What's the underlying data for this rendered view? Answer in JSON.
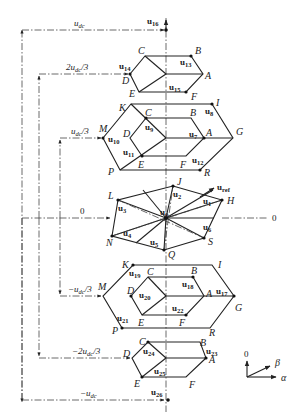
{
  "levels": [
    {
      "id": "udc",
      "label": "u",
      "label_sub": "dc",
      "prefix": "",
      "suffix": "",
      "y": 30
    },
    {
      "id": "2udc3",
      "label": "u",
      "label_sub": "dc",
      "prefix": "2",
      "suffix": "/3",
      "y": 74
    },
    {
      "id": "udc3",
      "label": "u",
      "label_sub": "dc",
      "prefix": "",
      "suffix": "/3",
      "y": 138
    },
    {
      "id": "zero",
      "label": "0",
      "y": 218
    },
    {
      "id": "mudc3",
      "label": "u",
      "label_sub": "dc",
      "prefix": "−",
      "suffix": "/3",
      "y": 296
    },
    {
      "id": "m2udc3",
      "label": "u",
      "label_sub": "dc",
      "prefix": "−2",
      "suffix": "/3",
      "y": 358
    },
    {
      "id": "mudc",
      "label": "u",
      "label_sub": "dc",
      "prefix": "−",
      "suffix": "",
      "y": 400
    }
  ],
  "zero_right_label": "0",
  "vectors": {
    "u0": {
      "name": "u",
      "sub": "0"
    },
    "u1": {
      "name": "u",
      "sub": "1"
    },
    "u2": {
      "name": "u",
      "sub": "2"
    },
    "u3": {
      "name": "u",
      "sub": "3"
    },
    "u4": {
      "name": "u",
      "sub": "4"
    },
    "u5": {
      "name": "u",
      "sub": "5"
    },
    "u6": {
      "name": "u",
      "sub": "6"
    },
    "u7": {
      "name": "u",
      "sub": "7"
    },
    "u8": {
      "name": "u",
      "sub": "8"
    },
    "u9": {
      "name": "u",
      "sub": "9"
    },
    "u10": {
      "name": "u",
      "sub": "10"
    },
    "u11": {
      "name": "u",
      "sub": "11"
    },
    "u12": {
      "name": "u",
      "sub": "12"
    },
    "u13": {
      "name": "u",
      "sub": "13"
    },
    "u14": {
      "name": "u",
      "sub": "14"
    },
    "u15": {
      "name": "u",
      "sub": "15"
    },
    "u16": {
      "name": "u",
      "sub": "16"
    },
    "u17": {
      "name": "u",
      "sub": "17"
    },
    "u18": {
      "name": "u",
      "sub": "18"
    },
    "u19": {
      "name": "u",
      "sub": "19"
    },
    "u20": {
      "name": "u",
      "sub": "20"
    },
    "u21": {
      "name": "u",
      "sub": "21"
    },
    "u22": {
      "name": "u",
      "sub": "22"
    },
    "u23": {
      "name": "u",
      "sub": "23"
    },
    "u24": {
      "name": "u",
      "sub": "24"
    },
    "u25": {
      "name": "u",
      "sub": "25"
    },
    "u26": {
      "name": "u",
      "sub": "26"
    },
    "uref": {
      "name": "u",
      "sub": "ref"
    }
  },
  "vertex_labels": {
    "A": "A",
    "B": "B",
    "C": "C",
    "D": "D",
    "E": "E",
    "F": "F",
    "G": "G",
    "H": "H",
    "I": "I",
    "J": "J",
    "K": "K",
    "L": "L",
    "M": "M",
    "N": "N",
    "P": "P",
    "Q": "Q",
    "R": "R",
    "S": "S"
  },
  "axes_legend": {
    "zero_axis": "0",
    "beta_axis": "β",
    "alpha_axis": "α"
  }
}
